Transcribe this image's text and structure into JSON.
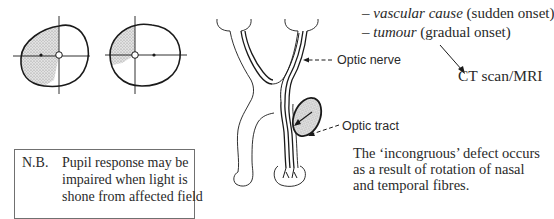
{
  "visual_fields": {
    "left_eye": {
      "description": "left eye visual field with shaded defect on left half",
      "shaded_side": "left"
    },
    "right_eye": {
      "description": "right eye visual field with shaded defect on upper-left quadrant area",
      "shaded_side": "left"
    }
  },
  "pathway": {
    "labels": {
      "optic_nerve": "Optic nerve",
      "optic_tract": "Optic tract"
    },
    "lesion": "stippled mass compressing optic tract"
  },
  "causes": {
    "items": [
      {
        "dash": "–",
        "cause": "vascular cause",
        "onset": "(sudden onset)"
      },
      {
        "dash": "–",
        "cause": "tumour",
        "onset": "(gradual onset)"
      }
    ],
    "investigation": "CT scan/MRI"
  },
  "note": {
    "prefix": "N.B.",
    "lines": [
      "Pupil response may be",
      "impaired when light is",
      "shone from affected field"
    ]
  },
  "explanation": {
    "lines": [
      "The ‘incongruous’ defect occurs",
      "as a result of rotation of nasal",
      "and temporal fibres."
    ]
  },
  "colors": {
    "ink": "#1a1a1a",
    "shading": "#cfcfcf",
    "box_border": "#707070"
  }
}
